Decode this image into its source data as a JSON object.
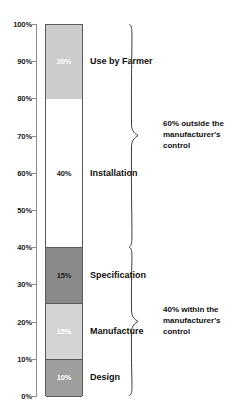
{
  "chart_data": {
    "type": "bar",
    "title": "",
    "subtitle": "",
    "xlabel": "",
    "ylabel": "",
    "ylim": [
      0,
      100
    ],
    "grid": false,
    "legend_position": "right-inline",
    "stacked": true,
    "orientation": "vertical",
    "categories": [
      "Design",
      "Manufacture",
      "Specification",
      "Installation",
      "Use by Farmer"
    ],
    "values": [
      10,
      15,
      15,
      40,
      20
    ],
    "yticks": [
      "0%",
      "10%",
      "20%",
      "30%",
      "40%",
      "50%",
      "60%",
      "70%",
      "80%",
      "90%",
      "100%"
    ],
    "ytick_values": [
      0,
      10,
      20,
      30,
      40,
      50,
      60,
      70,
      80,
      90,
      100
    ],
    "segments": [
      {
        "label": "Design",
        "value_label": "10%",
        "value": 10,
        "start": 0,
        "end": 10,
        "fill": "#9e9e9e",
        "value_color": "#ffffff"
      },
      {
        "label": "Manufacture",
        "value_label": "15%",
        "value": 15,
        "start": 10,
        "end": 25,
        "fill": "#d4d4d4",
        "value_color": "#ffffff"
      },
      {
        "label": "Specification",
        "value_label": "15%",
        "value": 15,
        "start": 25,
        "end": 40,
        "fill": "#8a8a8a",
        "value_color": "#1a1a1a"
      },
      {
        "label": "Installation",
        "value_label": "40%",
        "value": 40,
        "start": 40,
        "end": 80,
        "fill": "#ffffff",
        "value_color": "#1a1a1a"
      },
      {
        "label": "Use by Farmer",
        "value_label": "20%",
        "value": 20,
        "start": 80,
        "end": 100,
        "fill": "#cccccc",
        "value_color": "#ffffff"
      }
    ],
    "annotations": [
      {
        "name": "outside-control",
        "text": "60% outside the manufacturer's control",
        "span_start": 40,
        "span_end": 100,
        "percent": 60
      },
      {
        "name": "within-control",
        "text": "40% within the manufacturer's control",
        "span_start": 0,
        "span_end": 40,
        "percent": 40
      }
    ],
    "colors": {
      "axis": "#8c8c8c",
      "outline": "#5a5a5a",
      "text": "#101010",
      "background": "#ffffff"
    }
  }
}
